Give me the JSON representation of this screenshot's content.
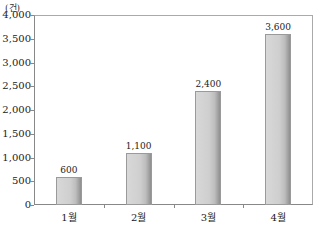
{
  "chart_data": {
    "type": "bar",
    "title": "",
    "unit_label": "(건)",
    "xlabel": "",
    "ylabel": "(건)",
    "categories": [
      "1월",
      "2월",
      "3월",
      "4월"
    ],
    "values": [
      600,
      1100,
      2400,
      3600
    ],
    "value_labels": [
      "600",
      "1,100",
      "2,400",
      "3,600"
    ],
    "ylim": [
      0,
      4000
    ],
    "yticks": [
      0,
      500,
      1000,
      1500,
      2000,
      2500,
      3000,
      3500,
      4000
    ],
    "ytick_labels": [
      "0",
      "500",
      "1,000",
      "1,500",
      "2,000",
      "2,500",
      "3,000",
      "3,500",
      "4,000"
    ],
    "grid": false,
    "legend": null,
    "bar_color": "#c8c8c8"
  }
}
